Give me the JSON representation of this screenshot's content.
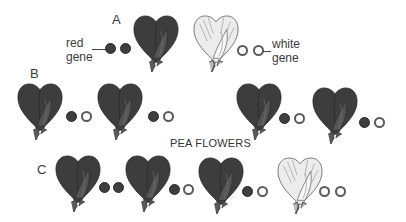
{
  "title": "PEA FLOWERS",
  "rows": {
    "A": {
      "label": "A"
    },
    "B": {
      "label": "B"
    },
    "C": {
      "label": "C"
    }
  },
  "legend": {
    "red_gene": "red\ngene",
    "red_line1": "red",
    "red_line2": "gene",
    "white_line1": "white",
    "white_line2": "gene"
  },
  "colors": {
    "red_flower": "#3d3d3d",
    "white_flower": "#e6e6e6",
    "red_gene": "#3e3e3e",
    "white_gene": "#ffffff"
  },
  "flowers": [
    {
      "row": "A",
      "color": "red",
      "genes": [
        "red",
        "red"
      ]
    },
    {
      "row": "A",
      "color": "white",
      "genes": [
        "white",
        "white"
      ]
    },
    {
      "row": "B",
      "color": "red",
      "genes": [
        "red",
        "white"
      ]
    },
    {
      "row": "B",
      "color": "red",
      "genes": [
        "red",
        "white"
      ]
    },
    {
      "row": "B",
      "color": "red",
      "genes": [
        "red",
        "white"
      ]
    },
    {
      "row": "B",
      "color": "red",
      "genes": [
        "red",
        "white"
      ]
    },
    {
      "row": "C",
      "color": "red",
      "genes": [
        "red",
        "red"
      ]
    },
    {
      "row": "C",
      "color": "red",
      "genes": [
        "red",
        "white"
      ]
    },
    {
      "row": "C",
      "color": "red",
      "genes": [
        "red",
        "white"
      ]
    },
    {
      "row": "C",
      "color": "white",
      "genes": [
        "white",
        "white"
      ]
    }
  ]
}
